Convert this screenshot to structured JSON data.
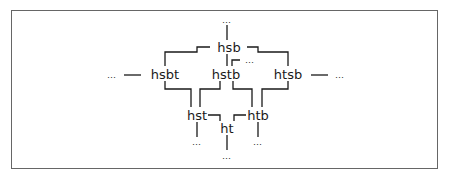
{
  "diagram": {
    "type": "lattice",
    "nodes": [
      {
        "id": "hsb",
        "label": "hsb",
        "x": 229,
        "y": 47
      },
      {
        "id": "hsbt",
        "label": "hsbt",
        "x": 165,
        "y": 73
      },
      {
        "id": "hstb",
        "label": "hstb",
        "x": 225,
        "y": 73
      },
      {
        "id": "htsb",
        "label": "htsb",
        "x": 288,
        "y": 73
      },
      {
        "id": "hst",
        "label": "hst",
        "x": 197,
        "y": 115
      },
      {
        "id": "ht",
        "label": "ht",
        "x": 227,
        "y": 128
      },
      {
        "id": "htb",
        "label": "htb",
        "x": 258,
        "y": 115
      }
    ],
    "ellipses": [
      {
        "id": "dots-top",
        "label": "…",
        "x": 227,
        "y": 21
      },
      {
        "id": "dots-left",
        "label": "…",
        "x": 112,
        "y": 75
      },
      {
        "id": "dots-right",
        "label": "…",
        "x": 340,
        "y": 75
      },
      {
        "id": "dots-hstb-side",
        "label": "…",
        "x": 250,
        "y": 60
      },
      {
        "id": "dots-hst-below",
        "label": "…",
        "x": 197,
        "y": 143
      },
      {
        "id": "dots-ht-below",
        "label": "…",
        "x": 227,
        "y": 156
      },
      {
        "id": "dots-htb-below",
        "label": "…",
        "x": 258,
        "y": 143
      }
    ],
    "edges": [
      [
        "dots-top",
        "hsb"
      ],
      [
        "hsb",
        "hsbt"
      ],
      [
        "hsb",
        "hstb"
      ],
      [
        "hsb",
        "htsb"
      ],
      [
        "hstb",
        "dots-hstb-side"
      ],
      [
        "dots-left",
        "hsbt"
      ],
      [
        "htsb",
        "dots-right"
      ],
      [
        "hsbt",
        "hst"
      ],
      [
        "hstb",
        "hst"
      ],
      [
        "hstb",
        "htb"
      ],
      [
        "htsb",
        "htb"
      ],
      [
        "hst",
        "ht"
      ],
      [
        "htb",
        "ht"
      ],
      [
        "hst",
        "dots-hst-below"
      ],
      [
        "ht",
        "dots-ht-below"
      ],
      [
        "htb",
        "dots-htb-below"
      ]
    ]
  }
}
